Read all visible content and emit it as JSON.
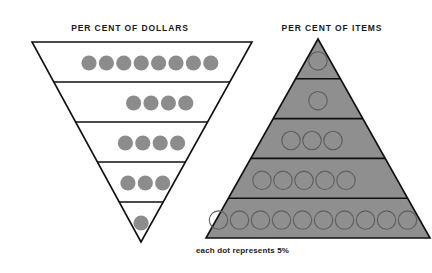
{
  "page": {
    "background_color": "#ffffff",
    "width": 432,
    "height": 273
  },
  "left_figure": {
    "title": "PER CENT OF DOLLARS",
    "shape": "inverted-triangle",
    "fill_color": "#ffffff",
    "stroke_color": "#111111",
    "dot_color": "#8c8c8c",
    "dot_style": "filled",
    "bands": [
      {
        "index": 1,
        "dots": 8,
        "percent": 40
      },
      {
        "index": 2,
        "dots": 4,
        "percent": 20
      },
      {
        "index": 3,
        "dots": 4,
        "percent": 20
      },
      {
        "index": 4,
        "dots": 3,
        "percent": 15
      },
      {
        "index": 5,
        "dots": 1,
        "percent": 5
      }
    ],
    "total_dots": 20,
    "total_percent": 100
  },
  "right_figure": {
    "title": "PER CENT OF ITEMS",
    "shape": "pyramid",
    "fill_color": "#8f8f8f",
    "stroke_color": "#111111",
    "dot_color": "#8f8f8f",
    "dot_outline_color": "#5e5e5e",
    "dot_style": "outlined",
    "bands": [
      {
        "index": 1,
        "dots": 1,
        "percent": 5
      },
      {
        "index": 2,
        "dots": 1,
        "percent": 5
      },
      {
        "index": 3,
        "dots": 3,
        "percent": 15
      },
      {
        "index": 4,
        "dots": 5,
        "percent": 25
      },
      {
        "index": 5,
        "dots": 10,
        "percent": 50
      }
    ],
    "total_dots": 20,
    "total_percent": 100
  },
  "caption": {
    "text": "each dot represents 5%"
  },
  "chart_data": {
    "type": "pyramid-dot-chart",
    "title": "",
    "subtitle": "",
    "annotations": [
      "each dot represents 5%"
    ],
    "unit": "dot = 5%",
    "legend_position": "below-right-figure",
    "grid": false,
    "categories": [
      "Band 1 (top)",
      "Band 2",
      "Band 3",
      "Band 4",
      "Band 5 (bottom)"
    ],
    "series": [
      {
        "name": "PER CENT OF DOLLARS",
        "shape": "inverted-triangle",
        "dots": [
          8,
          4,
          4,
          3,
          1
        ],
        "values": [
          40,
          20,
          20,
          15,
          5
        ],
        "total": 100
      },
      {
        "name": "PER CENT OF ITEMS",
        "shape": "pyramid",
        "dots": [
          1,
          1,
          3,
          5,
          10
        ],
        "values": [
          5,
          5,
          15,
          25,
          50
        ],
        "total": 100
      }
    ],
    "xlabel": "",
    "ylabel": "",
    "ylim": [
      0,
      50
    ]
  }
}
